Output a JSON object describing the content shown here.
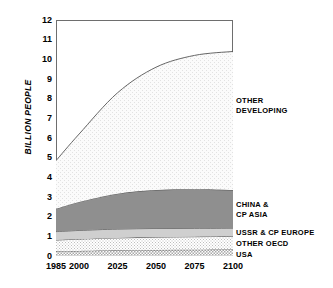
{
  "chart_data": {
    "type": "area",
    "stacked": true,
    "title": "",
    "xlabel": "",
    "ylabel": "BILLION PEOPLE",
    "x": [
      1985,
      2000,
      2025,
      2050,
      2075,
      2100
    ],
    "xlim": [
      1985,
      2100
    ],
    "ylim": [
      0,
      12
    ],
    "y_ticks": [
      0,
      1,
      2,
      3,
      4,
      5,
      6,
      7,
      8,
      9,
      10,
      11,
      12
    ],
    "x_ticks": [
      1985,
      2000,
      2025,
      2050,
      2075,
      2100
    ],
    "x_tick_labels": [
      "1985",
      "2000",
      "2025",
      "2050",
      "2075",
      "2100"
    ],
    "y_tick_labels": [
      "0",
      "1",
      "2",
      "3",
      "4",
      "5",
      "6",
      "7",
      "8",
      "9",
      "10",
      "11",
      "12"
    ],
    "grid": false,
    "legend_position": "right-inline",
    "series": [
      {
        "name": "USA",
        "label": "USA",
        "fill": "dotted-medium",
        "color": "#c9c9c9",
        "values": [
          0.24,
          0.26,
          0.29,
          0.31,
          0.32,
          0.33
        ]
      },
      {
        "name": "OTHER OECD",
        "label": "OTHER  OECD",
        "fill": "dotted-light",
        "color": "#dedede",
        "values": [
          0.57,
          0.6,
          0.63,
          0.65,
          0.66,
          0.67
        ]
      },
      {
        "name": "USSR & CP EUROPE",
        "label": "USSR & CP  EUROPE",
        "fill": "solid-light-gray",
        "color": "#cfcfcf",
        "values": [
          0.43,
          0.44,
          0.45,
          0.44,
          0.43,
          0.42
        ]
      },
      {
        "name": "CHINA & CP ASIA",
        "label_line1": "CHINA  &",
        "label_line2": "CP  ASIA",
        "fill": "solid-dark-gray",
        "color": "#8f8f8f",
        "values": [
          1.16,
          1.45,
          1.8,
          1.95,
          1.98,
          1.93
        ]
      },
      {
        "name": "OTHER DEVELOPING",
        "label_line1": "OTHER",
        "label_line2": "DEVELOPING",
        "fill": "dotted-very-light",
        "color": "#f0f0f0",
        "values": [
          2.45,
          3.45,
          5.13,
          6.25,
          6.81,
          7.05
        ]
      }
    ],
    "cumulative_totals": [
      4.85,
      6.2,
      8.3,
      9.6,
      10.2,
      10.4
    ],
    "annotations": []
  },
  "axis": {
    "y_title": "BILLION PEOPLE"
  }
}
